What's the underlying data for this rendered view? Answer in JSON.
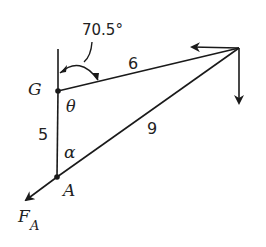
{
  "diagram": {
    "type": "free-body force diagram (triangle)",
    "angle_label": "70.5°",
    "points": {
      "G": "G",
      "A": "A"
    },
    "angles": {
      "theta": "θ",
      "alpha": "α"
    },
    "sides": {
      "GA": "5",
      "G_to_right": "6",
      "A_to_right": "9"
    },
    "force_label": {
      "main": "F",
      "subscript": "A"
    },
    "colors": {
      "stroke": "#1a1a1a",
      "background": "#ffffff"
    }
  }
}
